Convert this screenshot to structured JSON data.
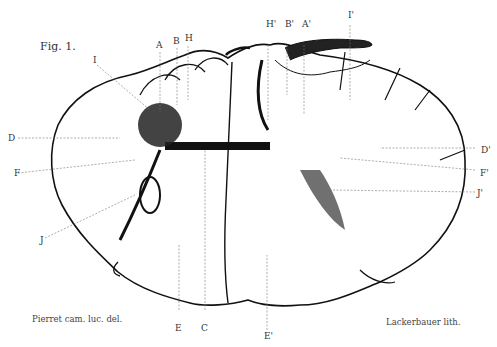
{
  "figure": {
    "title": "Fig. 1.",
    "credit_left": "Pierret cam. luc. del.",
    "credit_right": "Lackerbauer lith."
  },
  "labels": {
    "A": "A",
    "B": "B",
    "H": "H",
    "I": "I",
    "D": "D",
    "F": "F",
    "J": "J",
    "E": "E",
    "C": "C",
    "H_prime": "H'",
    "B_prime": "B'",
    "A_prime": "A'",
    "I_prime": "I'",
    "D_prime": "D'",
    "F_prime": "F'",
    "J_prime": "J'",
    "E_prime": "E'"
  },
  "colors": {
    "ink": "#111111",
    "paper": "#ffffff",
    "leader": "#777777"
  }
}
